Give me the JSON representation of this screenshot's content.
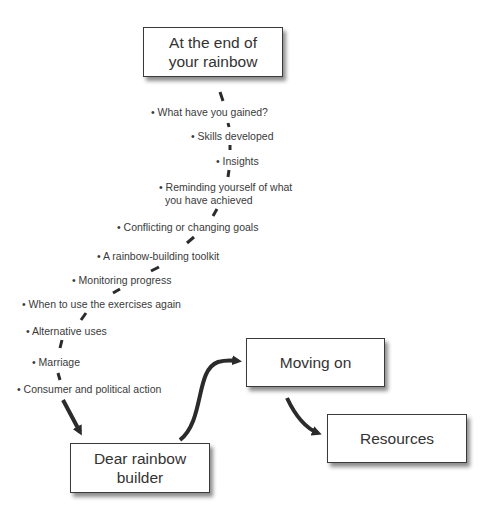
{
  "boxes": {
    "top": "At the end of your rainbow",
    "top_line1": "At the end of",
    "top_line2": "your rainbow",
    "moving_on": "Moving on",
    "resources": "Resources",
    "dear_line1": "Dear rainbow",
    "dear_line2": "builder"
  },
  "items": [
    "• What have you gained?",
    "• Skills developed",
    "• Insights",
    "• Reminding yourself of what",
    "you have achieved",
    "• Conflicting or changing goals",
    "• A rainbow-building toolkit",
    "• Monitoring progress",
    "• When to use the exercises again",
    "• Alternative uses",
    "• Marriage",
    "• Consumer and political action"
  ],
  "colors": {
    "stroke": "#2b2b2b",
    "text": "#3a3a3a"
  }
}
